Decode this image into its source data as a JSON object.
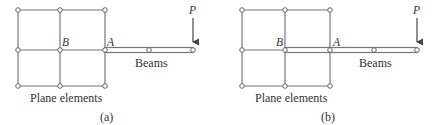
{
  "colors": {
    "line": "#777777",
    "text": "#333333",
    "node_fill": "#ffffff"
  },
  "panels": [
    {
      "id": "a",
      "caption": "(a)",
      "plane_label": "Plane elements",
      "beam_label": "Beams",
      "point_labels": {
        "B": "B",
        "A": "A"
      },
      "load_label": "P",
      "description": "Beam attached to plane element mesh only at node A"
    },
    {
      "id": "b",
      "caption": "(b)",
      "plane_label": "Plane elements",
      "beam_label": "Beams",
      "point_labels": {
        "B": "B",
        "A": "A"
      },
      "load_label": "P",
      "description": "Beam extended into mesh from node B through node A"
    }
  ]
}
